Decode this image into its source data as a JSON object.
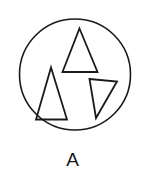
{
  "figure": {
    "caption": "A",
    "background_color": "#ffffff",
    "stroke_color": "#1a1a1a",
    "container": {
      "shape_name": "circle",
      "cx": 75,
      "cy": 74.5,
      "r": 55.5,
      "stroke_width": 1.6
    },
    "shapes": [
      {
        "name": "upper-triangle",
        "type": "triangle",
        "orientation": "upright",
        "stroke_width": 1.8,
        "points": "79.5,28.5 97.5,72 62.5,72"
      },
      {
        "name": "left-triangle",
        "type": "triangle",
        "orientation": "upright",
        "stroke_width": 1.8,
        "points": "51,67.5 67,119.5 36,119.5"
      },
      {
        "name": "right-triangle",
        "type": "triangle",
        "orientation": "rotated",
        "stroke_width": 1.8,
        "points": "89.5,79 117,81.5 96,118"
      }
    ]
  }
}
